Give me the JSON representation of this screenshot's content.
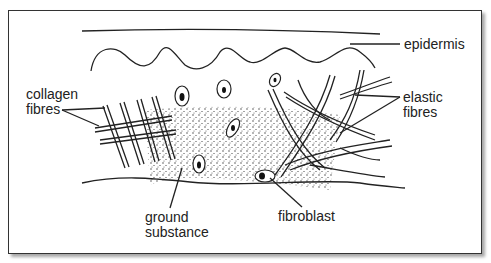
{
  "diagram": {
    "type": "labelled biological diagram",
    "labels": [
      {
        "id": "epidermis",
        "text": "epidermis"
      },
      {
        "id": "collagen",
        "line1": "collagen",
        "line2": "fibres"
      },
      {
        "id": "elastic",
        "line1": "elastic",
        "line2": "fibres"
      },
      {
        "id": "ground",
        "line1": "ground",
        "line2": "substance"
      },
      {
        "id": "fibroblast",
        "text": "fibroblast"
      }
    ],
    "colors": {
      "line": "#222222",
      "background": "#ffffff",
      "frame": "#333333"
    }
  }
}
